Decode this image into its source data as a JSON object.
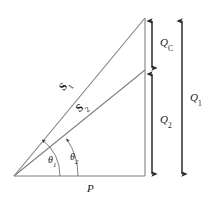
{
  "figure": {
    "type": "power-triangle-diagram",
    "background_color": "#ffffff",
    "line_color": "#808080",
    "arrow_color": "#2b2b2b",
    "text_color": "#1a1a1a"
  },
  "labels": {
    "s1": {
      "symbol": "S",
      "subscript": "1",
      "style": "bold-vector"
    },
    "s2": {
      "symbol": "S",
      "subscript": "2",
      "style": "bold-vector"
    },
    "theta1": {
      "symbol": "θ",
      "subscript": "1",
      "style": "italic-greek"
    },
    "theta2": {
      "symbol": "θ",
      "subscript": "2",
      "style": "italic-greek"
    },
    "p": {
      "symbol": "P",
      "subscript": "",
      "style": "italic"
    },
    "qc": {
      "symbol": "Q",
      "subscript": "C",
      "style": "italic"
    },
    "q1": {
      "symbol": "Q",
      "subscript": "1",
      "style": "italic"
    },
    "q2": {
      "symbol": "Q",
      "subscript": "2",
      "style": "italic"
    }
  },
  "geometry": {
    "origin": {
      "x": 14,
      "y": 176
    },
    "base_end": {
      "x": 145,
      "y": 176
    },
    "apex": {
      "x": 145,
      "y": 18
    },
    "s2_end": {
      "x": 145,
      "y": 70
    },
    "qc_arrow": {
      "x": 152,
      "y_top": 20,
      "y_bottom": 69
    },
    "q2_arrow": {
      "x": 152,
      "y_top": 73,
      "y_bottom": 175
    },
    "q1_arrow": {
      "x": 182,
      "y_top": 20,
      "y_bottom": 175
    },
    "theta1_arc_radius": 46,
    "theta2_arc_radius": 64
  }
}
